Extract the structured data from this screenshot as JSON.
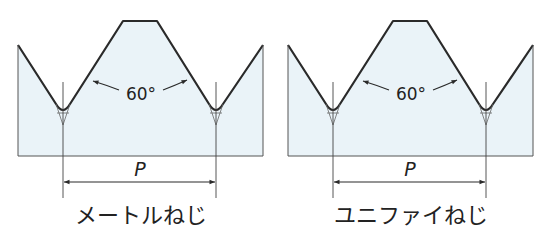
{
  "colors": {
    "fill": "#eaf3f8",
    "stroke": "#2a2a2a",
    "thin": "#555555",
    "background": "#ffffff"
  },
  "diagrams": [
    {
      "name": "metric-thread",
      "angle_label": "60°",
      "pitch_label": "P",
      "title": "メートルねじ"
    },
    {
      "name": "unified-thread",
      "angle_label": "60°",
      "pitch_label": "P",
      "title": "ユニファイねじ"
    }
  ]
}
